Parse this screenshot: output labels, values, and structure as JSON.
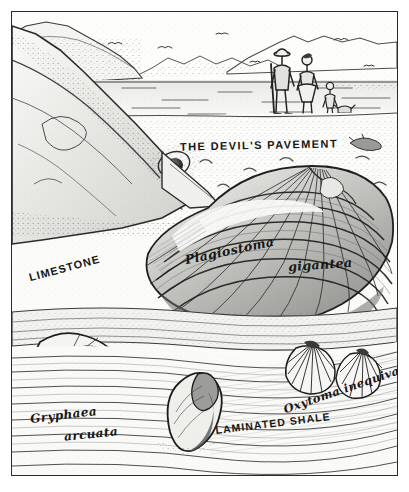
{
  "artwork": {
    "title": "The Devil's Pavement",
    "medium": "pen-and-ink hatched illustration",
    "palette": {
      "ink": "#171717",
      "paper": "#fbfbfa",
      "mid_tone": "#8b8b8b",
      "light_tone": "#d8d8d4",
      "frame": "#2a2a2a"
    }
  },
  "labels": {
    "devils_pavement": "THE DEVIL'S PAVEMENT",
    "limestone": "LIMESTONE",
    "plagiostoma": "Plagiostoma",
    "gigantea": "gigantea",
    "oxytoma": "Oxytoma inequivalvis",
    "gryphaea": "Gryphaea",
    "arcuata": "arcuata",
    "laminated_shale": "LAMINATED SHALE"
  },
  "scene": {
    "sky": "open pale sky above a distant headland",
    "background": "range of low hills and cliffs on the far shore",
    "sea": "flat sea with scattered wave streaks on the horizon",
    "birds_in_flight": 7,
    "figures": [
      {
        "name": "adult-with-staff",
        "description": "standing adult wearing a wide brimmed hat, holding a long staff"
      },
      {
        "name": "adult-in-dress",
        "description": "standing adult in a dress beside the first figure"
      },
      {
        "name": "child",
        "description": "small child standing to the right of the adults"
      },
      {
        "name": "dog",
        "description": "small dog at the right of the group"
      }
    ],
    "foreground": "wave-cut limestone platform strewn with large fossil bivalves"
  },
  "fossils": [
    {
      "name": "plagiostoma-gigantea",
      "description": "very large fan shaped bivalve with concentric growth bands and fine radiating ribs, dominating the centre of the plate"
    },
    {
      "name": "gryphaea-arcuata",
      "description": "strongly curved devil's toenail oyster at lower left with coiled umbo and radiating growth lines"
    },
    {
      "name": "oxytoma-inequivalvis",
      "description": "pair of small fan shaped shells with sharp radiating ribs at lower right"
    },
    {
      "name": "belemnite-guard",
      "description": "dark elongated fossil lying on the laminated shale at bottom centre"
    }
  ],
  "geology": {
    "upper_bed": "LIMESTONE",
    "pavement": "THE DEVIL'S PAVEMENT",
    "lower_bed": "LAMINATED SHALE"
  }
}
